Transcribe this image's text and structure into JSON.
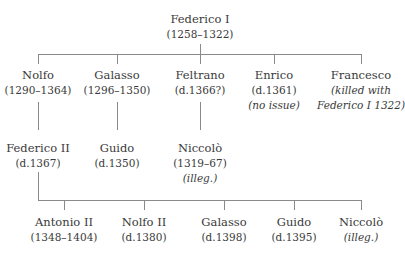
{
  "root": {
    "name": "Federico I",
    "dates": "(1258–1322)"
  },
  "gen2": [
    {
      "name": "Nolfo",
      "dates": "(1290–1364)",
      "note": ""
    },
    {
      "name": "Galasso",
      "dates": "(1296–1350)",
      "note": ""
    },
    {
      "name": "Feltrano",
      "dates": "(d.1366?)",
      "note": ""
    },
    {
      "name": "Enrico",
      "dates": "(d.1361)",
      "note": "(no issue)"
    },
    {
      "name": "Francesco",
      "dates": "(killed with",
      "note": "Federico I 1322)"
    }
  ],
  "gen3": [
    {
      "name": "Federico II",
      "dates": "(d.1367)",
      "note": ""
    },
    {
      "name": "Guido",
      "dates": "(d.1350)",
      "note": ""
    },
    {
      "name": "Niccolò",
      "dates": "(1319–67)",
      "note": "(illeg.)"
    }
  ],
  "gen4": [
    {
      "name": "Antonio II",
      "dates": "(1348–1404)"
    },
    {
      "name": "Nolfo II",
      "dates": "(d.1380)"
    },
    {
      "name": "Galasso",
      "dates": "(d.1398)"
    },
    {
      "name": "Guido",
      "dates": "(d.1395)"
    },
    {
      "name": "Niccolò",
      "dates": "(illeg.)"
    }
  ],
  "colors": {
    "line": "#8a8a8a",
    "text": "#3a3a3a"
  }
}
